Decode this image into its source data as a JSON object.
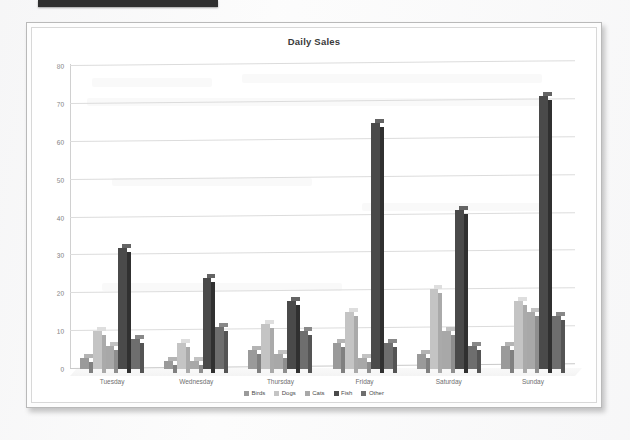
{
  "document": {
    "top_strip": "black-redaction-bar"
  },
  "chart_data": {
    "type": "bar",
    "title": "Daily Sales",
    "xlabel": "",
    "ylabel": "",
    "ylim": [
      0,
      80
    ],
    "yticks": [
      0,
      10,
      20,
      30,
      40,
      50,
      60,
      70,
      80
    ],
    "grid": true,
    "legend_position": "bottom",
    "categories": [
      "Tuesday",
      "Wednesday",
      "Thursday",
      "Friday",
      "Saturday",
      "Sunday"
    ],
    "series": [
      {
        "name": "Birds",
        "color": "#9a9a9a",
        "values": [
          3,
          2,
          5,
          7,
          4,
          6
        ]
      },
      {
        "name": "Dogs",
        "color": "#c4c4c4",
        "values": [
          10,
          7,
          12,
          15,
          21,
          18
        ]
      },
      {
        "name": "Cats",
        "color": "#a8a8a8",
        "values": [
          6,
          2,
          4,
          3,
          10,
          15
        ]
      },
      {
        "name": "Fish",
        "color": "#4a4a4a",
        "values": [
          32,
          24,
          18,
          65,
          42,
          72
        ]
      },
      {
        "name": "Other",
        "color": "#6e6e6e",
        "values": [
          8,
          11,
          10,
          7,
          6,
          14
        ]
      }
    ]
  }
}
